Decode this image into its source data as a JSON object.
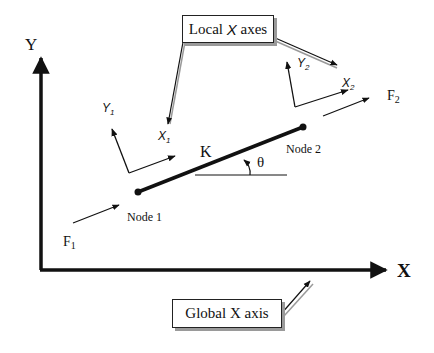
{
  "diagram": {
    "global_axes": {
      "y_label": "Y",
      "x_label": "X"
    },
    "element": {
      "stiffness_label": "K",
      "angle_label": "θ",
      "node1_label": "Node 1",
      "node2_label": "Node 2"
    },
    "local_frames": {
      "node1": {
        "x_label": "X",
        "x_sub": "1",
        "y_label": "Y",
        "y_sub": "1"
      },
      "node2": {
        "x_label": "X",
        "x_sub": "2",
        "y_label": "Y",
        "y_sub": "2"
      }
    },
    "forces": {
      "f1": {
        "label": "F",
        "sub": "1"
      },
      "f2": {
        "label": "F",
        "sub": "2"
      }
    },
    "callouts": {
      "local": {
        "prefix": "Local ",
        "italic": "X",
        "suffix": " axes"
      },
      "global": {
        "text": "Global X axis"
      }
    },
    "colors": {
      "ink": "#111111",
      "callout_shadow": "#9a9a9a"
    }
  }
}
